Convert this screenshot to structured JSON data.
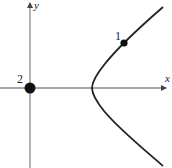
{
  "diagram": {
    "type": "hyperbola-branch-with-points",
    "axes": {
      "x_label": "x",
      "y_label": "y",
      "color": "#8a8a8a"
    },
    "curve": {
      "description": "right branch of a hyperbola opening rightward, vertex on positive x-axis",
      "color": "#222222"
    },
    "points": [
      {
        "label": "1",
        "location": "on upper part of curve"
      },
      {
        "label": "2",
        "location": "at origin"
      }
    ],
    "point_color": "#111111"
  }
}
